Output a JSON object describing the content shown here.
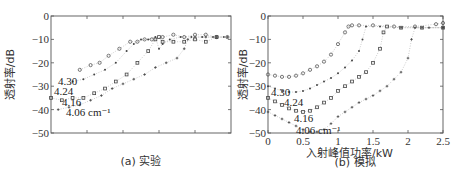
{
  "chart_data": [
    {
      "type": "scatter",
      "panel": "a",
      "caption": "(a) 实验",
      "title": "",
      "xlabel": "",
      "ylabel": "透射率/dB",
      "ylim": [
        -50,
        0
      ],
      "yticks": [
        0,
        -10,
        -20,
        -30,
        -40,
        -50
      ],
      "xticks_labeled": false,
      "xlim": [
        0,
        1
      ],
      "grid": false,
      "annotations": [
        "4.30",
        "4.24",
        "4.16",
        "4.06 cm⁻¹"
      ],
      "series": [
        {
          "name": "4.30",
          "marker": "circle",
          "x": [
            0.16,
            0.22,
            0.27,
            0.32,
            0.38,
            0.44,
            0.48,
            0.52,
            0.56,
            0.62,
            0.68,
            0.74,
            0.8,
            0.86,
            0.92,
            0.98
          ],
          "y": [
            -23,
            -21,
            -20,
            -17,
            -14,
            -11,
            -11,
            -10,
            -10,
            -9,
            -8,
            -9,
            -8,
            -8,
            -9,
            -9
          ]
        },
        {
          "name": "4.24",
          "marker": "dot",
          "x": [
            0.12,
            0.18,
            0.24,
            0.3,
            0.36,
            0.42,
            0.46,
            0.5,
            0.54,
            0.58,
            0.6,
            0.62,
            0.66,
            0.72,
            0.78,
            0.84,
            0.9,
            0.96
          ],
          "y": [
            -28,
            -27,
            -25,
            -23,
            -20,
            -15,
            -12,
            -10,
            -10,
            -9,
            -14,
            -12,
            -10,
            -9,
            -9,
            -9,
            -9,
            -9
          ]
        },
        {
          "name": "4.16",
          "marker": "square",
          "x": [
            0,
            0.06,
            0.12,
            0.18,
            0.24,
            0.3,
            0.36,
            0.42,
            0.48,
            0.54,
            0.58,
            0.6,
            0.62,
            0.68,
            0.74,
            0.8,
            0.86,
            0.92
          ],
          "y": [
            -35,
            -36,
            -35,
            -35,
            -33,
            -31,
            -28,
            -25,
            -20,
            -15,
            -10,
            -9,
            -11,
            -11,
            -11,
            -10,
            -11,
            -9
          ]
        },
        {
          "name": "4.06 cm⁻¹",
          "marker": "plus",
          "x": [
            0.04,
            0.1,
            0.16,
            0.22,
            0.28,
            0.34,
            0.4,
            0.46,
            0.52,
            0.58,
            0.64,
            0.7,
            0.74,
            0.76,
            0.8,
            0.86,
            0.92,
            0.98
          ],
          "y": [
            -40,
            -39,
            -38,
            -36,
            -34,
            -31,
            -29,
            -27,
            -25,
            -22,
            -20,
            -18,
            -14,
            -10,
            -9,
            -9,
            -9,
            -9
          ]
        }
      ]
    },
    {
      "type": "scatter",
      "panel": "b",
      "caption": "(b) 模拟",
      "title": "",
      "xlabel": "入射峰值功率/kW",
      "ylabel": "透射率/dB",
      "xlim": [
        0,
        2.5
      ],
      "ylim": [
        -50,
        0
      ],
      "xticks": [
        "0",
        "0.5",
        "1",
        "1.5",
        "2",
        "2.5"
      ],
      "yticks": [
        0,
        -10,
        -20,
        -30,
        -40,
        -50
      ],
      "grid": false,
      "annotations": [
        "4.30",
        "4.24",
        "4.16",
        "4.06 cm⁻¹"
      ],
      "series": [
        {
          "name": "4.30",
          "marker": "circle",
          "x": [
            0,
            0.1,
            0.2,
            0.3,
            0.4,
            0.5,
            0.6,
            0.7,
            0.8,
            0.9,
            1.0,
            1.1,
            1.15,
            1.2,
            1.3,
            1.5,
            1.8,
            2.1,
            2.4,
            2.5
          ],
          "y": [
            -25,
            -25.5,
            -26,
            -26,
            -25.5,
            -24.5,
            -23,
            -21.5,
            -19.5,
            -16.5,
            -12,
            -7,
            -4.5,
            -4,
            -4,
            -4,
            -4.5,
            -4.5,
            -3.5,
            -3
          ]
        },
        {
          "name": "4.24",
          "marker": "dot",
          "x": [
            0,
            0.1,
            0.2,
            0.3,
            0.4,
            0.5,
            0.6,
            0.7,
            0.8,
            0.9,
            1.0,
            1.1,
            1.2,
            1.3,
            1.35,
            1.4,
            1.6,
            1.9,
            2.2,
            2.5
          ],
          "y": [
            -30,
            -31,
            -32,
            -32.5,
            -32.5,
            -32,
            -31,
            -29.5,
            -28,
            -26.5,
            -24.5,
            -22,
            -19,
            -15,
            -10,
            -4.5,
            -4.5,
            -5,
            -5,
            -5
          ]
        },
        {
          "name": "4.16",
          "marker": "square",
          "x": [
            0,
            0.1,
            0.2,
            0.3,
            0.4,
            0.5,
            0.6,
            0.7,
            0.8,
            0.9,
            1.0,
            1.1,
            1.2,
            1.3,
            1.4,
            1.5,
            1.6,
            1.65,
            1.7,
            1.9,
            2.2,
            2.5
          ],
          "y": [
            -35,
            -36.5,
            -38,
            -39.5,
            -40.5,
            -41,
            -40.5,
            -39,
            -37,
            -35,
            -32,
            -30,
            -28,
            -26,
            -24,
            -20,
            -14,
            -7,
            -4.5,
            -5,
            -5,
            -5
          ]
        },
        {
          "name": "4.06 cm⁻¹",
          "marker": "plus",
          "x": [
            0,
            0.1,
            0.2,
            0.3,
            0.4,
            0.5,
            0.6,
            0.7,
            0.8,
            0.9,
            1.0,
            1.1,
            1.2,
            1.3,
            1.4,
            1.5,
            1.6,
            1.7,
            1.8,
            1.9,
            2.0,
            2.05,
            2.1,
            2.3,
            2.5
          ],
          "y": [
            -41,
            -42.5,
            -44,
            -45.5,
            -47,
            -48.5,
            -49.5,
            -49.5,
            -48.5,
            -46,
            -43,
            -41,
            -39,
            -37,
            -35.5,
            -34,
            -32,
            -30,
            -27,
            -24,
            -18,
            -10,
            -5,
            -5,
            -5
          ]
        }
      ]
    }
  ]
}
